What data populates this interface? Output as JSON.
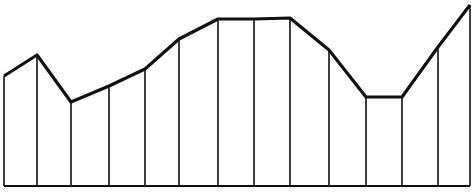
{
  "chart_data": {
    "type": "line",
    "title": "",
    "xlabel": "",
    "ylabel": "",
    "grid": false,
    "legend": "none",
    "drop_lines": true,
    "x": [
      0,
      1,
      2,
      3,
      4,
      5,
      6,
      7,
      8,
      9,
      10,
      11,
      12,
      13
    ],
    "values": [
      110,
      131,
      84,
      100,
      117,
      147,
      167,
      167,
      168,
      136,
      89,
      89,
      139,
      181
    ],
    "ylim": [
      0,
      190
    ],
    "line_color": "#111111",
    "background": "#ffffff"
  }
}
